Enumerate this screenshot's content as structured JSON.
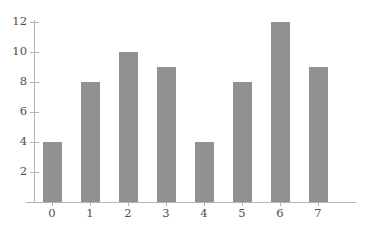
{
  "chart_data": {
    "type": "bar",
    "title": "",
    "title_clipped": true,
    "xlabel": "",
    "ylabel": "",
    "categories": [
      "0",
      "1",
      "2",
      "3",
      "4",
      "5",
      "6",
      "7"
    ],
    "values": [
      4,
      8,
      10,
      9,
      4,
      8,
      12,
      9
    ],
    "series": [
      {
        "name": "counts",
        "values": [
          4,
          8,
          10,
          9,
          4,
          8,
          12,
          9
        ]
      }
    ],
    "x": [
      0,
      1,
      2,
      3,
      4,
      5,
      6,
      7
    ],
    "ylim": [
      0,
      12.8
    ],
    "xlim": [
      -0.7,
      8.2
    ],
    "yticks": [
      2,
      4,
      6,
      8,
      10,
      12
    ],
    "ytick_labels": [
      "2",
      "4",
      "6",
      "8",
      "10",
      "12"
    ],
    "xticks": [
      0,
      1,
      2,
      3,
      4,
      5,
      6,
      7
    ],
    "xtick_labels": [
      "0",
      "1",
      "2",
      "3",
      "4",
      "5",
      "6",
      "7"
    ],
    "grid": false,
    "legend": null,
    "legend_position": "none",
    "annotations": [],
    "bar_color": "#919191",
    "axis_color": "#b3b3b3",
    "tick_label_color": "#4c4c4c",
    "background_color": "#ffffff"
  }
}
